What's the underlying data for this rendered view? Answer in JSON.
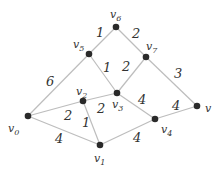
{
  "graph": {
    "nodes": [
      {
        "id": "v0",
        "base": "v",
        "sub": "0",
        "x": 28,
        "y": 116,
        "lx": 8,
        "ly": 132
      },
      {
        "id": "v1",
        "base": "v",
        "sub": "1",
        "x": 100,
        "y": 145,
        "lx": 94,
        "ly": 162
      },
      {
        "id": "v2",
        "base": "v",
        "sub": "2",
        "x": 83,
        "y": 101,
        "lx": 76,
        "ly": 95
      },
      {
        "id": "v3",
        "base": "v",
        "sub": "3",
        "x": 117,
        "y": 93,
        "lx": 112,
        "ly": 108
      },
      {
        "id": "v4",
        "base": "v",
        "sub": "4",
        "x": 155,
        "y": 119,
        "lx": 161,
        "ly": 133
      },
      {
        "id": "v5",
        "base": "v",
        "sub": "5",
        "x": 89,
        "y": 54,
        "lx": 73,
        "ly": 48
      },
      {
        "id": "v6",
        "base": "v",
        "sub": "6",
        "x": 116,
        "y": 27,
        "lx": 110,
        "ly": 18
      },
      {
        "id": "v7",
        "base": "v",
        "sub": "7",
        "x": 146,
        "y": 57,
        "lx": 146,
        "ly": 50
      },
      {
        "id": "v",
        "base": "v",
        "sub": "",
        "x": 197,
        "y": 106,
        "lx": 205,
        "ly": 112
      }
    ],
    "edges": [
      {
        "from": "v0",
        "to": "v5",
        "weight": "6",
        "wx": 46,
        "wy": 86
      },
      {
        "from": "v0",
        "to": "v2",
        "weight": "2",
        "wx": 64,
        "wy": 120
      },
      {
        "from": "v0",
        "to": "v1",
        "weight": "4",
        "wx": 55,
        "wy": 143
      },
      {
        "from": "v2",
        "to": "v1",
        "weight": "1",
        "wx": 82,
        "wy": 127
      },
      {
        "from": "v2",
        "to": "v3",
        "weight": "2",
        "wx": 97,
        "wy": 113
      },
      {
        "from": "v5",
        "to": "v6",
        "weight": "1",
        "wx": 96,
        "wy": 37
      },
      {
        "from": "v5",
        "to": "v3",
        "weight": "1",
        "wx": 103,
        "wy": 72
      },
      {
        "from": "v6",
        "to": "v7",
        "weight": "2",
        "wx": 132,
        "wy": 38
      },
      {
        "from": "v7",
        "to": "v3",
        "weight": "2",
        "wx": 122,
        "wy": 71
      },
      {
        "from": "v7",
        "to": "v",
        "weight": "3",
        "wx": 174,
        "wy": 78
      },
      {
        "from": "v3",
        "to": "v4",
        "weight": "4",
        "wx": 138,
        "wy": 104
      },
      {
        "from": "v1",
        "to": "v4",
        "weight": "4",
        "wx": 133,
        "wy": 142
      },
      {
        "from": "v4",
        "to": "v",
        "weight": "4",
        "wx": 172,
        "wy": 110
      }
    ]
  }
}
